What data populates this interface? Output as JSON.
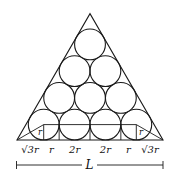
{
  "diagram": {
    "circle_count": 10,
    "rows": [
      1,
      2,
      3,
      4
    ],
    "base_labels": [
      "√3r",
      "r",
      "2r",
      "2r",
      "r",
      "√3r"
    ],
    "inner_labels": [
      "r",
      "r"
    ],
    "dimension_label": "L"
  }
}
